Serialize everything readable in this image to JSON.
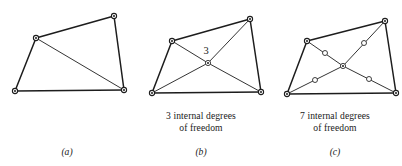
{
  "figure": {
    "background": "#ffffff",
    "line_color": "#1d1d1d",
    "node_fill": "#ffffff",
    "width": 402,
    "height": 166
  },
  "panels": [
    {
      "id": "a",
      "label": "(a)",
      "caption_lines": [],
      "quad": [
        {
          "x": 114,
          "y": 16
        },
        {
          "x": 36,
          "y": 38
        },
        {
          "x": 15,
          "y": 91
        },
        {
          "x": 124,
          "y": 90
        }
      ],
      "outer_edges": [
        [
          0,
          1
        ],
        [
          1,
          2
        ],
        [
          2,
          3
        ],
        [
          3,
          0
        ]
      ],
      "inner_edges": [
        [
          1,
          3
        ]
      ],
      "corner_nodes": [
        {
          "x": 114,
          "y": 16
        },
        {
          "x": 36,
          "y": 38
        },
        {
          "x": 15,
          "y": 91
        },
        {
          "x": 124,
          "y": 90
        }
      ],
      "interior_nodes": [],
      "center_node": null,
      "annotation": null
    },
    {
      "id": "b",
      "label": "(b)",
      "caption_lines": [
        "3 internal degrees",
        "of freedom"
      ],
      "quad": [
        {
          "x": 250,
          "y": 19
        },
        {
          "x": 172,
          "y": 41
        },
        {
          "x": 152,
          "y": 93
        },
        {
          "x": 261,
          "y": 92
        }
      ],
      "outer_edges": [
        [
          0,
          1
        ],
        [
          1,
          2
        ],
        [
          2,
          3
        ],
        [
          3,
          0
        ]
      ],
      "inner_edges": [],
      "corner_nodes": [
        {
          "x": 250,
          "y": 19
        },
        {
          "x": 172,
          "y": 41
        },
        {
          "x": 152,
          "y": 93
        },
        {
          "x": 261,
          "y": 92
        }
      ],
      "interior_nodes": [],
      "center_node": {
        "x": 208,
        "y": 63
      },
      "spokes_from_center": [
        0,
        1,
        2,
        3
      ],
      "annotation": {
        "text": "3",
        "x": 206,
        "y": 54
      }
    },
    {
      "id": "c",
      "label": "(c)",
      "caption_lines": [
        "7 internal degrees",
        "of freedom"
      ],
      "quad": [
        {
          "x": 385,
          "y": 21
        },
        {
          "x": 307,
          "y": 41
        },
        {
          "x": 287,
          "y": 94
        },
        {
          "x": 396,
          "y": 93
        }
      ],
      "outer_edges": [
        [
          0,
          1
        ],
        [
          1,
          2
        ],
        [
          2,
          3
        ],
        [
          3,
          0
        ]
      ],
      "inner_edges": [],
      "corner_nodes": [
        {
          "x": 385,
          "y": 21
        },
        {
          "x": 307,
          "y": 41
        },
        {
          "x": 287,
          "y": 94
        },
        {
          "x": 396,
          "y": 93
        }
      ],
      "center_node": {
        "x": 343,
        "y": 66
      },
      "spokes_from_center": [
        0,
        1,
        2,
        3
      ],
      "interior_nodes": [
        {
          "x": 364,
          "y": 43
        },
        {
          "x": 325,
          "y": 53
        },
        {
          "x": 315,
          "y": 80
        },
        {
          "x": 369,
          "y": 79
        }
      ],
      "annotation": null
    }
  ]
}
